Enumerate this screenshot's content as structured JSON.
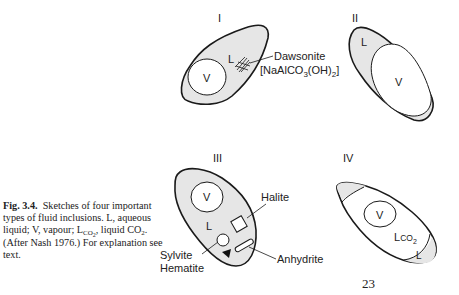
{
  "caption": {
    "fig_label": "Fig. 3.4.",
    "line1": "Sketches of four important types of fluid inclusions.",
    "line2_prefix": "L, aqueous liquid; V, vapour; L",
    "lco2_sub": "CO",
    "lco2_subsub": "2",
    "line2_suffix": ", liquid CO",
    "co2_sub": "2",
    "line3": ". (After Nash 1976.) For explanation see text."
  },
  "panels": {
    "I": {
      "numeral": "I",
      "liquid": "L",
      "vapour": "V",
      "mineral_label": "Dawsonite",
      "formula_prefix": "[NaAlCO",
      "formula_sub1": "3",
      "formula_mid": "(OH)",
      "formula_sub2": "2",
      "formula_suffix": "]"
    },
    "II": {
      "numeral": "II",
      "liquid": "L",
      "vapour": "V"
    },
    "III": {
      "numeral": "III",
      "liquid": "L",
      "vapour": "V",
      "halite": "Halite",
      "sylvite": "Sylvite",
      "hematite": "Hematite",
      "anhydrite": "Anhydrite"
    },
    "IV": {
      "numeral": "IV",
      "vapour": "V",
      "lco2": "L",
      "lco2_sub": "CO",
      "lco2_subsub": "2",
      "liquid": "L"
    }
  },
  "page_number": "23",
  "colors": {
    "fill": "#e6e6e6",
    "stroke": "#1a1a1a",
    "text": "#222222"
  }
}
